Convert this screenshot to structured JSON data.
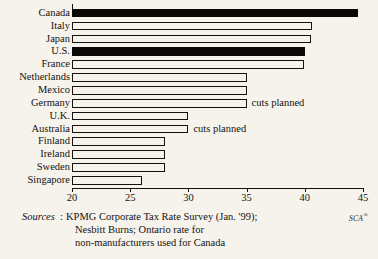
{
  "chart_data": {
    "type": "bar",
    "orientation": "horizontal",
    "title": "",
    "xlabel": "",
    "ylabel": "",
    "xlim": [
      20,
      45
    ],
    "xticks": [
      20,
      25,
      30,
      35,
      40,
      45
    ],
    "xtick_labels": [
      "20",
      "25",
      "30",
      "35",
      "40",
      "45"
    ],
    "grid": false,
    "legend": "none",
    "categories": [
      "Canada",
      "Italy",
      "Japan",
      "U.S.",
      "France",
      "Netherlands",
      "Mexico",
      "Germany",
      "U.K.",
      "Australia",
      "Finland",
      "Ireland",
      "Sweden",
      "Singapore"
    ],
    "values": [
      44.6,
      40.6,
      40.5,
      40.0,
      39.9,
      35.0,
      35.0,
      35.0,
      30.0,
      30.0,
      28.0,
      28.0,
      28.0,
      26.0
    ],
    "highlighted": [
      "Canada",
      "U.S."
    ],
    "bar_styles": [
      "filled",
      "open",
      "open",
      "filled",
      "open",
      "open",
      "open",
      "open",
      "open",
      "open",
      "open",
      "open",
      "open",
      "open"
    ],
    "annotations": [
      {
        "category": "Germany",
        "text": "cuts planned"
      },
      {
        "category": "Australia",
        "text": "cuts planned"
      }
    ]
  },
  "footer": {
    "sources_word": "Sources",
    "colon": ":",
    "lines": [
      "KPMG Corporate Tax Rate Survey (Jan. '99);",
      "Nesbitt Burns; Ontario rate for",
      "non-manufacturers used for Canada"
    ],
    "mark": "SCA",
    "mark_sup": "®"
  }
}
